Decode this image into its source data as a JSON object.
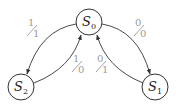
{
  "diagram": {
    "type": "finite-state-machine",
    "colors": {
      "stroke": "#333333",
      "label": "#9a9a9a",
      "background": "#ffffff"
    },
    "states": [
      {
        "id": "S0",
        "letter": "S",
        "sub": "0",
        "cx": 89,
        "cy": 22,
        "r": 13
      },
      {
        "id": "S1",
        "letter": "S",
        "sub": "1",
        "cx": 155,
        "cy": 87,
        "r": 13
      },
      {
        "id": "S2",
        "letter": "S",
        "sub": "2",
        "cx": 21,
        "cy": 87,
        "r": 13
      }
    ],
    "transitions": [
      {
        "from": "S0",
        "to": "S2",
        "input": "1",
        "output": "1"
      },
      {
        "from": "S2",
        "to": "S0",
        "input": "1",
        "output": "0"
      },
      {
        "from": "S0",
        "to": "S1",
        "input": "0",
        "output": "0"
      },
      {
        "from": "S1",
        "to": "S0",
        "input": "0",
        "output": "1"
      }
    ]
  }
}
